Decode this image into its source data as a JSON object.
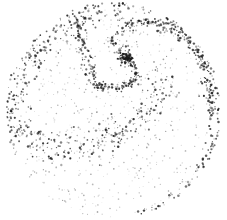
{
  "image": {
    "width": 227,
    "height": 220,
    "background": "#ffffff",
    "point_color": "#1a1a1a",
    "description": "spiral point cloud within a circular boundary"
  },
  "chart_data": {
    "type": "scatter",
    "title": "",
    "xlabel": "",
    "ylabel": "",
    "grid": false,
    "legend": null,
    "shape": {
      "disk_center": [
        113,
        110
      ],
      "disk_radius": 108,
      "core_center": [
        126,
        58
      ],
      "arms": [
        {
          "name": "inner-arm",
          "points": [
            [
              126,
              58
            ],
            [
              118,
              48
            ],
            [
              112,
              40
            ],
            [
              118,
              30
            ],
            [
              135,
              22
            ],
            [
              160,
              22
            ],
            [
              180,
              32
            ],
            [
              196,
              48
            ],
            [
              205,
              68
            ],
            [
              210,
              95
            ],
            [
              212,
              120
            ]
          ],
          "density": 260,
          "spread": 3.2
        },
        {
          "name": "core-hook",
          "points": [
            [
              126,
              58
            ],
            [
              134,
              66
            ],
            [
              138,
              76
            ],
            [
              130,
              84
            ],
            [
              116,
              88
            ],
            [
              100,
              86
            ],
            [
              92,
              80
            ]
          ],
          "density": 120,
          "spread": 2.2
        },
        {
          "name": "outer-arm-right",
          "points": [
            [
              160,
              22
            ],
            [
              190,
              30
            ],
            [
              210,
              55
            ],
            [
              222,
              90
            ],
            [
              222,
              125
            ],
            [
              212,
              155
            ],
            [
              198,
              178
            ],
            [
              180,
              198
            ],
            [
              160,
              212
            ],
            [
              140,
              218
            ]
          ],
          "density": 260,
          "spread": 5
        },
        {
          "name": "outer-arm-left",
          "points": [
            [
              150,
              6
            ],
            [
              120,
              5
            ],
            [
              90,
              12
            ],
            [
              62,
              26
            ],
            [
              40,
              46
            ],
            [
              22,
              72
            ],
            [
              12,
              100
            ],
            [
              14,
              125
            ],
            [
              28,
              140
            ],
            [
              55,
              150
            ],
            [
              90,
              145
            ],
            [
              120,
              132
            ],
            [
              145,
              115
            ],
            [
              160,
              95
            ],
            [
              168,
              75
            ]
          ],
          "density": 520,
          "spread": 8
        },
        {
          "name": "inner-left-band",
          "points": [
            [
              78,
              20
            ],
            [
              82,
              40
            ],
            [
              88,
              60
            ],
            [
              92,
              80
            ]
          ],
          "density": 90,
          "spread": 4
        }
      ],
      "halo_points": 650,
      "seed": 7
    }
  }
}
